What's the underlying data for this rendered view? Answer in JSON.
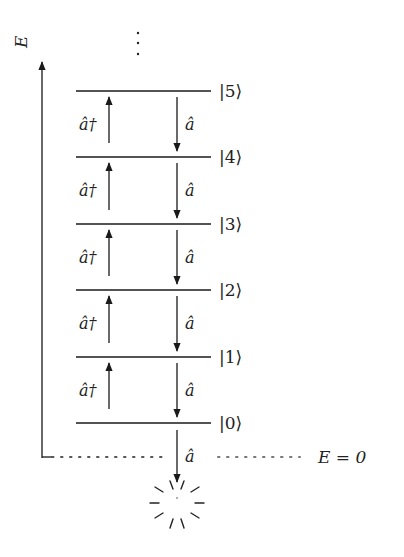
{
  "diagram": {
    "axis_label": "E",
    "continuation": "⋮",
    "levels": [
      {
        "label": "|5⟩",
        "y": 91
      },
      {
        "label": "|4⟩",
        "y": 157
      },
      {
        "label": "|3⟩",
        "y": 224
      },
      {
        "label": "|2⟩",
        "y": 290
      },
      {
        "label": "|1⟩",
        "y": 357
      },
      {
        "label": "|0⟩",
        "y": 423
      }
    ],
    "raising_operator": "â†",
    "lowering_operator": "â",
    "zero_line_label": "E = 0",
    "annihilation_symbol": "vacuum-burst"
  },
  "colors": {
    "line": "#1a1a1a",
    "dotted": "#555555",
    "background": "#ffffff"
  }
}
